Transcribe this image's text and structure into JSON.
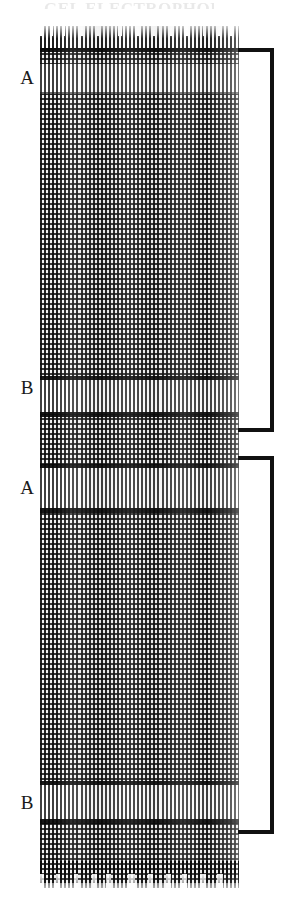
{
  "figure": {
    "kind": "autoradiograph-sequencing-gel",
    "caption_sliver_text": "GEL ELECTROPHORESIS",
    "background_color": "#ffffff",
    "ink_color": "#111111",
    "gel": {
      "left": 40,
      "top": 26,
      "width": 199,
      "height": 862,
      "lane_pitch_px": 4,
      "band_pitch_px": 5
    }
  },
  "row_labels": [
    {
      "id": "label-a-1",
      "text": "A",
      "x": 14,
      "y": 68
    },
    {
      "id": "label-b-1",
      "text": "B",
      "x": 14,
      "y": 378
    },
    {
      "id": "label-a-2",
      "text": "A",
      "x": 14,
      "y": 478
    },
    {
      "id": "label-b-2",
      "text": "B",
      "x": 14,
      "y": 793
    }
  ],
  "pale_bands": [
    {
      "id": "pale-band-a-1",
      "top": 38,
      "height": 30
    },
    {
      "id": "pale-band-b-1",
      "top": 352,
      "height": 36
    },
    {
      "id": "pale-band-a-2",
      "top": 440,
      "height": 44
    },
    {
      "id": "pale-band-b-2",
      "top": 757,
      "height": 38
    }
  ],
  "rules": [
    {
      "id": "rule-top",
      "top": 22,
      "height": 4,
      "soft": false
    },
    {
      "id": "rule-a1-under",
      "top": 66,
      "height": 3,
      "soft": true
    },
    {
      "id": "rule-b1-over",
      "top": 350,
      "height": 4,
      "soft": false
    },
    {
      "id": "rule-b1-under",
      "top": 386,
      "height": 5,
      "soft": false
    },
    {
      "id": "rule-a2-over",
      "top": 438,
      "height": 4,
      "soft": false
    },
    {
      "id": "rule-a2-under",
      "top": 482,
      "height": 5,
      "soft": false
    },
    {
      "id": "rule-b2-over",
      "top": 755,
      "height": 4,
      "soft": false
    },
    {
      "id": "rule-b2-under",
      "top": 793,
      "height": 5,
      "soft": false
    }
  ],
  "brackets": [
    {
      "id": "bracket-upper",
      "label": "",
      "top": 48,
      "height": 384
    },
    {
      "id": "bracket-lower",
      "label": "",
      "top": 456,
      "height": 378
    }
  ]
}
